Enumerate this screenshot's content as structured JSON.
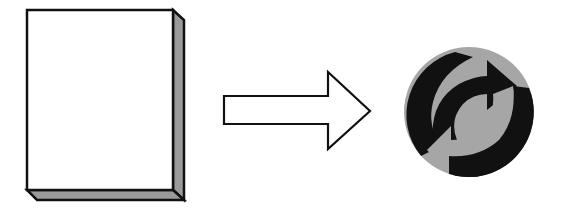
{
  "diagram": {
    "elements": [
      {
        "id": "paper",
        "label": "paper-sheet",
        "icon": "paper-stack-icon"
      },
      {
        "id": "arrow",
        "label": "right-arrow",
        "icon": "arrow-right-icon"
      },
      {
        "id": "recycle",
        "label": "green-dot-recycling-symbol",
        "icon": "recycle-icon"
      }
    ],
    "colors": {
      "background": "#ffffff",
      "outline": "#111111",
      "paper_face": "#ffffff",
      "paper_edge": "#9a9a9a",
      "recycle_light": "#a6a6a6",
      "recycle_dark": "#111111"
    }
  }
}
